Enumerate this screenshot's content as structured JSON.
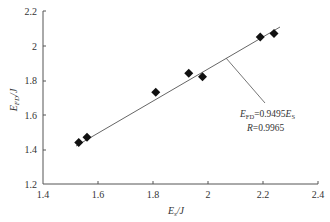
{
  "chart_data": {
    "type": "scatter",
    "title": "",
    "xlabel": "E_s/J",
    "ylabel": "E_FD/J",
    "xlim": [
      1.4,
      2.4
    ],
    "ylim": [
      1.2,
      2.2
    ],
    "x_ticks": [
      "1.4",
      "1.6",
      "1.8",
      "2",
      "2.2",
      "2.4"
    ],
    "y_ticks": [
      "1.2",
      "1.4",
      "1.6",
      "1.8",
      "2",
      "2.2"
    ],
    "grid": false,
    "legend": null,
    "series": [
      {
        "name": "measured",
        "marker": "diamond",
        "x": [
          1.53,
          1.56,
          1.81,
          1.93,
          1.98,
          2.19,
          2.24
        ],
        "y": [
          1.44,
          1.47,
          1.73,
          1.84,
          1.82,
          2.05,
          2.07
        ]
      }
    ],
    "fit": {
      "equation": "E_FD = 0.9495 E_s",
      "slope": 0.9495,
      "intercept": 0,
      "R": 0.9965,
      "x_range": [
        1.52,
        2.26
      ]
    },
    "annotations": [
      {
        "text": "E_FD=0.9495E_S",
        "type": "equation"
      },
      {
        "text": "R=0.9965",
        "type": "correlation"
      }
    ]
  },
  "labels": {
    "x_axis_main": "E",
    "x_axis_sub": "s",
    "x_axis_unit": "/J",
    "y_axis_main": "E",
    "y_axis_sub": "FD",
    "y_axis_unit": "/J",
    "eq_lhs": "E",
    "eq_lhs_sub": "FD",
    "eq_mid": "=0.9495",
    "eq_rhs": "E",
    "eq_rhs_sub": "S",
    "r_main": "R",
    "r_value": "=0.9965"
  },
  "ticks": {
    "x": [
      "1.4",
      "1.6",
      "1.8",
      "2",
      "2.2",
      "2.4"
    ],
    "y": [
      "1.2",
      "1.4",
      "1.6",
      "1.8",
      "2",
      "2.2"
    ]
  }
}
